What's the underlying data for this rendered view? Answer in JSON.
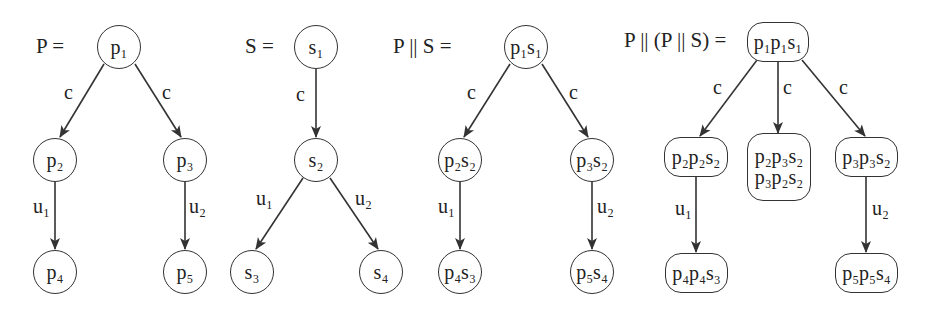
{
  "diagrams": [
    {
      "title": "P =",
      "nodes": [
        {
          "id": "p1",
          "text": "p₁"
        },
        {
          "id": "p2",
          "text": "p₂"
        },
        {
          "id": "p3",
          "text": "p₃"
        },
        {
          "id": "p4",
          "text": "p₄"
        },
        {
          "id": "p5",
          "text": "p₅"
        }
      ],
      "edges": [
        {
          "from": "p1",
          "to": "p2",
          "label": "c"
        },
        {
          "from": "p1",
          "to": "p3",
          "label": "c"
        },
        {
          "from": "p2",
          "to": "p4",
          "label": "u₁"
        },
        {
          "from": "p3",
          "to": "p5",
          "label": "u₂"
        }
      ]
    },
    {
      "title": "S =",
      "nodes": [
        {
          "id": "s1",
          "text": "s₁"
        },
        {
          "id": "s2",
          "text": "s₂"
        },
        {
          "id": "s3",
          "text": "s₃"
        },
        {
          "id": "s4",
          "text": "s₄"
        }
      ],
      "edges": [
        {
          "from": "s1",
          "to": "s2",
          "label": "c"
        },
        {
          "from": "s2",
          "to": "s3",
          "label": "u₁"
        },
        {
          "from": "s2",
          "to": "s4",
          "label": "u₂"
        }
      ]
    },
    {
      "title": "P || S =",
      "nodes": [
        {
          "id": "p1s1",
          "text": "p₁s₁"
        },
        {
          "id": "p2s2",
          "text": "p₂s₂"
        },
        {
          "id": "p3s2",
          "text": "p₃s₂"
        },
        {
          "id": "p4s3",
          "text": "p₄s₃"
        },
        {
          "id": "p5s4",
          "text": "p₅s₄"
        }
      ],
      "edges": [
        {
          "from": "p1s1",
          "to": "p2s2",
          "label": "c"
        },
        {
          "from": "p1s1",
          "to": "p3s2",
          "label": "c"
        },
        {
          "from": "p2s2",
          "to": "p4s3",
          "label": "u₁"
        },
        {
          "from": "p3s2",
          "to": "p5s4",
          "label": "u₂"
        }
      ]
    },
    {
      "title": "P || (P || S) =",
      "nodes": [
        {
          "id": "p1p1s1",
          "text": "p₁p₁s₁"
        },
        {
          "id": "p2p2s2",
          "text": "p₂p₂s₂"
        },
        {
          "id": "mid",
          "text": "p₂p₃s₂",
          "text2": "p₃p₂s₂"
        },
        {
          "id": "p3p3s2",
          "text": "p₃p₃s₂"
        },
        {
          "id": "p4p4s3",
          "text": "p₄p₄s₃"
        },
        {
          "id": "p5p5s4",
          "text": "p₅p₅s₄"
        }
      ],
      "edges": [
        {
          "from": "p1p1s1",
          "to": "p2p2s2",
          "label": "c"
        },
        {
          "from": "p1p1s1",
          "to": "mid",
          "label": "c"
        },
        {
          "from": "p1p1s1",
          "to": "p3p3s2",
          "label": "c"
        },
        {
          "from": "p2p2s2",
          "to": "p4p4s3",
          "label": "u₁"
        },
        {
          "from": "p3p3s2",
          "to": "p5p5s4",
          "label": "u₂"
        }
      ]
    }
  ],
  "colors": {
    "stroke": "#333333",
    "text": "#222222",
    "background": "#ffffff"
  }
}
